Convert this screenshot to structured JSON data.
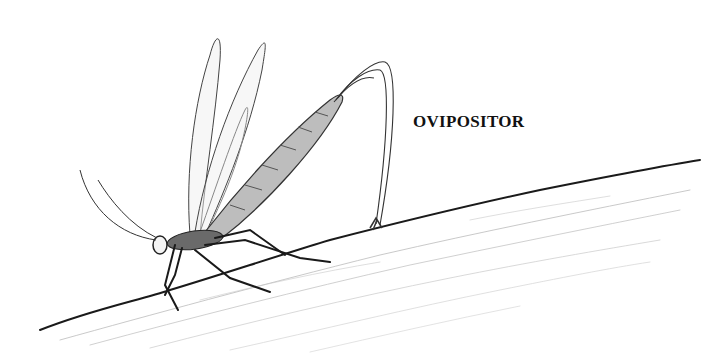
{
  "figure": {
    "labels": [
      {
        "text": "OVIPOSITOR",
        "points_to": "ovipositor"
      }
    ]
  },
  "colors": {
    "ink": "#1a1a1a",
    "shading": "#9a9a9a",
    "background": "#ffffff"
  }
}
